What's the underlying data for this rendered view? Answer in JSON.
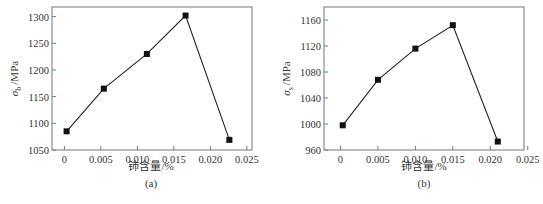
{
  "chart_data": [
    {
      "type": "line",
      "panel": "(a)",
      "title": "",
      "xlabel": "铈含量/%",
      "ylabel": "σb /MPa",
      "ylabel_symbol": "σ",
      "ylabel_sub": "b",
      "ylabel_unit": "/MPa",
      "x_ticks": [
        "0",
        "0.005",
        "0.010",
        "0.015",
        "0.020",
        "0.025"
      ],
      "y_ticks": [
        "1050",
        "1100",
        "1150",
        "1200",
        "1250",
        "1300"
      ],
      "xlim": [
        -0.0017,
        0.0257
      ],
      "ylim": [
        1050,
        1318
      ],
      "grid": false,
      "marker": "square",
      "series": [
        {
          "name": "σb",
          "x": [
            0.0003,
            0.0054,
            0.0113,
            0.0166,
            0.0226
          ],
          "y": [
            1085,
            1165,
            1230,
            1302,
            1069
          ]
        }
      ],
      "caption": "(a)"
    },
    {
      "type": "line",
      "panel": "(b)",
      "title": "",
      "xlabel": "铈含量/%",
      "ylabel": "σs /MPa",
      "ylabel_symbol": "σ",
      "ylabel_sub": "s",
      "ylabel_unit": "/MPa",
      "x_ticks": [
        "0",
        "0.005",
        "0.010",
        "0.015",
        "0.020",
        "0.025"
      ],
      "y_ticks": [
        "960",
        "1000",
        "1040",
        "1080",
        "1120",
        "1160"
      ],
      "xlim": [
        -0.0022,
        0.0245
      ],
      "ylim": [
        960,
        1180
      ],
      "grid": false,
      "marker": "square",
      "series": [
        {
          "name": "σs",
          "x": [
            0.0003,
            0.005,
            0.01,
            0.015,
            0.021
          ],
          "y": [
            998,
            1068,
            1116,
            1152,
            973
          ]
        }
      ],
      "caption": "(b)"
    }
  ]
}
